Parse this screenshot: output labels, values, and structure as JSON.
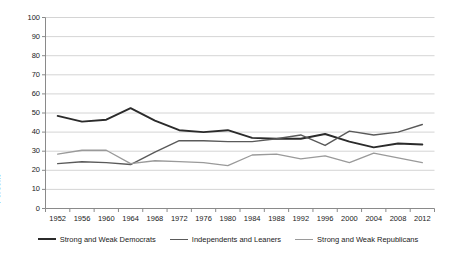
{
  "chart_data": {
    "type": "line",
    "title": "",
    "xlabel": "",
    "ylabel": "Percent",
    "ylim": [
      0,
      100
    ],
    "ytick_step": 10,
    "grid": "horizontal",
    "legend_position": "bottom",
    "categories": [
      1952,
      1956,
      1960,
      1964,
      1968,
      1972,
      1976,
      1980,
      1984,
      1988,
      1992,
      1996,
      2000,
      2004,
      2008,
      2012
    ],
    "ytick_labels": [
      "0",
      "10",
      "20",
      "30",
      "40",
      "50",
      "60",
      "70",
      "80",
      "90",
      "100"
    ],
    "xtick_labels": [
      "1952",
      "1956",
      "1960",
      "1964",
      "1968",
      "1972",
      "1976",
      "1980",
      "1984",
      "1988",
      "1992",
      "1996",
      "2000",
      "2004",
      "2008",
      "2012"
    ],
    "series": [
      {
        "name": "Strong and Weak Democrats",
        "color": "#2b2b2b",
        "width": 1.9,
        "values": [
          48.5,
          45.5,
          46.5,
          52.5,
          46.0,
          41.0,
          40.0,
          41.0,
          37.0,
          36.5,
          36.5,
          39.0,
          35.0,
          32.0,
          34.0,
          33.5
        ]
      },
      {
        "name": "Independents and Leaners",
        "color": "#5a5a5a",
        "width": 1.4,
        "values": [
          23.5,
          24.5,
          24.0,
          23.0,
          29.5,
          35.5,
          35.5,
          35.0,
          35.0,
          36.5,
          38.5,
          33.0,
          40.5,
          38.5,
          40.0,
          44.0
        ]
      },
      {
        "name": "Strong and Weak Republicans",
        "color": "#9a9a9a",
        "width": 1.3,
        "values": [
          28.5,
          30.5,
          30.5,
          23.5,
          25.0,
          24.5,
          24.0,
          22.5,
          28.0,
          28.5,
          26.0,
          27.5,
          24.0,
          29.0,
          26.5,
          24.0
        ]
      }
    ]
  },
  "axes": {
    "y_axis_title": "Percent"
  },
  "legend": {
    "items": [
      {
        "label": "Strong and Weak Democrats",
        "color": "#2b2b2b",
        "width": 2.2
      },
      {
        "label": "Independents and Leaners",
        "color": "#5a5a5a",
        "width": 1.6
      },
      {
        "label": "Strong and Weak Republicans",
        "color": "#9a9a9a",
        "width": 1.4
      }
    ]
  },
  "colors": {
    "background": "#ffffff",
    "gridline": "#c9c9c9",
    "axis": "#8a8a8a",
    "text": "#1a1a1a"
  }
}
